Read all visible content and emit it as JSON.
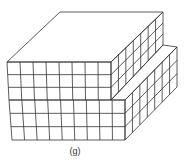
{
  "figure": {
    "caption": "(g)",
    "line_color": "#333333",
    "upper_block": {
      "front_cols": 8,
      "rows": 3,
      "side_cols": 7
    },
    "lower_block": {
      "front_cols": 9,
      "rows": 3,
      "side_cols": 7
    }
  }
}
